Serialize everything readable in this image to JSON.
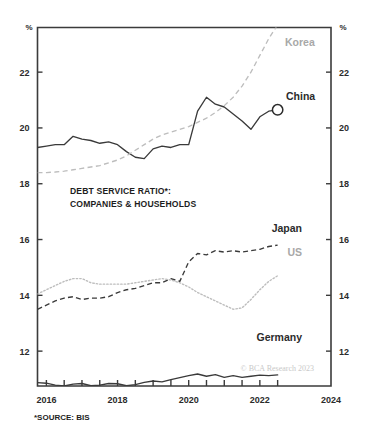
{
  "chart_data": {
    "type": "line",
    "title": "DEBT SERVICE RATIO*: COMPANIES & HOUSEHOLDS",
    "title_line1": "DEBT SERVICE RATIO*:",
    "title_line2": "COMPANIES & HOUSEHOLDS",
    "xlabel": "",
    "ylabel": "%",
    "ylabel_right": "%",
    "xlim": [
      2015.75,
      2024.0
    ],
    "ylim": [
      10.75,
      23.6
    ],
    "grid": false,
    "legend_position": "inline-right",
    "x_tick_labels": [
      "2016",
      "2018",
      "2020",
      "2022",
      "2024"
    ],
    "x_tick_values": [
      2016,
      2018,
      2020,
      2022,
      2024
    ],
    "x_minor_tick_values": [
      2016,
      2016.5,
      2017,
      2017.5,
      2018,
      2018.5,
      2019,
      2019.5,
      2020,
      2020.5,
      2021,
      2021.5,
      2022,
      2022.5
    ],
    "y_tick_labels": [
      "12",
      "14",
      "16",
      "18",
      "20",
      "22"
    ],
    "y_tick_values": [
      12,
      14,
      16,
      18,
      20,
      22
    ],
    "footnote": "*SOURCE: BIS",
    "watermark": "© BCA Research 2023",
    "series": [
      {
        "name": "China",
        "label": "China",
        "style": "solid",
        "color": "#3a3a3a",
        "label_color": "#2b2b2b",
        "end_marker": "circle",
        "x": [
          2015.75,
          2016.0,
          2016.25,
          2016.5,
          2016.75,
          2017.0,
          2017.25,
          2017.5,
          2017.75,
          2018.0,
          2018.25,
          2018.5,
          2018.75,
          2019.0,
          2019.25,
          2019.5,
          2019.75,
          2020.0,
          2020.25,
          2020.5,
          2020.75,
          2021.0,
          2021.25,
          2021.5,
          2021.75,
          2022.0,
          2022.25,
          2022.5
        ],
        "values": [
          19.3,
          19.35,
          19.4,
          19.4,
          19.7,
          19.6,
          19.55,
          19.45,
          19.5,
          19.4,
          19.15,
          18.95,
          18.9,
          19.25,
          19.35,
          19.3,
          19.4,
          19.4,
          20.6,
          21.1,
          20.85,
          20.75,
          20.5,
          20.25,
          19.95,
          20.4,
          20.6,
          20.65
        ]
      },
      {
        "name": "Korea",
        "label": "Korea",
        "style": "dashed",
        "color": "#bdbdbd",
        "label_color": "#a8a8a8",
        "end_marker": "none",
        "x": [
          2015.75,
          2016.0,
          2016.25,
          2016.5,
          2016.75,
          2017.0,
          2017.25,
          2017.5,
          2017.75,
          2018.0,
          2018.25,
          2018.5,
          2018.75,
          2019.0,
          2019.25,
          2019.5,
          2019.75,
          2020.0,
          2020.25,
          2020.5,
          2020.75,
          2021.0,
          2021.25,
          2021.5,
          2021.75,
          2022.0,
          2022.25,
          2022.5
        ],
        "values": [
          18.4,
          18.4,
          18.42,
          18.45,
          18.5,
          18.55,
          18.6,
          18.65,
          18.75,
          18.85,
          19.0,
          19.2,
          19.4,
          19.6,
          19.75,
          19.85,
          19.95,
          20.05,
          20.2,
          20.35,
          20.55,
          20.8,
          21.1,
          21.5,
          22.0,
          22.6,
          23.2,
          23.7
        ]
      },
      {
        "name": "Japan",
        "label": "Japan",
        "style": "dashed",
        "color": "#3a3a3a",
        "label_color": "#2b2b2b",
        "end_marker": "none",
        "x": [
          2015.75,
          2016.0,
          2016.25,
          2016.5,
          2016.75,
          2017.0,
          2017.25,
          2017.5,
          2017.75,
          2018.0,
          2018.25,
          2018.5,
          2018.75,
          2019.0,
          2019.25,
          2019.5,
          2019.75,
          2020.0,
          2020.25,
          2020.5,
          2020.75,
          2021.0,
          2021.25,
          2021.5,
          2021.75,
          2022.0,
          2022.25,
          2022.5
        ],
        "values": [
          13.5,
          13.65,
          13.8,
          13.9,
          13.95,
          13.85,
          13.9,
          13.9,
          13.95,
          14.1,
          14.2,
          14.25,
          14.35,
          14.45,
          14.45,
          14.6,
          14.5,
          15.2,
          15.5,
          15.45,
          15.6,
          15.55,
          15.6,
          15.55,
          15.6,
          15.65,
          15.75,
          15.8
        ]
      },
      {
        "name": "US",
        "label": "US",
        "style": "dotted",
        "color": "#bdbdbd",
        "label_color": "#a8a8a8",
        "end_marker": "none",
        "x": [
          2015.75,
          2016.0,
          2016.25,
          2016.5,
          2016.75,
          2017.0,
          2017.25,
          2017.5,
          2017.75,
          2018.0,
          2018.25,
          2018.5,
          2018.75,
          2019.0,
          2019.25,
          2019.5,
          2019.75,
          2020.0,
          2020.25,
          2020.5,
          2020.75,
          2021.0,
          2021.25,
          2021.5,
          2021.75,
          2022.0,
          2022.25,
          2022.5
        ],
        "values": [
          14.05,
          14.2,
          14.35,
          14.5,
          14.6,
          14.6,
          14.45,
          14.4,
          14.4,
          14.4,
          14.4,
          14.45,
          14.5,
          14.55,
          14.6,
          14.55,
          14.45,
          14.3,
          14.1,
          13.95,
          13.8,
          13.65,
          13.5,
          13.55,
          13.85,
          14.2,
          14.5,
          14.7
        ]
      },
      {
        "name": "Germany",
        "label": "Germany",
        "style": "solid",
        "color": "#3a3a3a",
        "label_color": "#2b2b2b",
        "end_marker": "none",
        "x": [
          2015.75,
          2016.0,
          2016.25,
          2016.5,
          2016.75,
          2017.0,
          2017.25,
          2017.5,
          2017.75,
          2018.0,
          2018.25,
          2018.5,
          2018.75,
          2019.0,
          2019.25,
          2019.5,
          2019.75,
          2020.0,
          2020.25,
          2020.5,
          2020.75,
          2021.0,
          2021.25,
          2021.5,
          2021.75,
          2022.0,
          2022.25,
          2022.5
        ],
        "values": [
          10.87,
          10.85,
          10.78,
          10.75,
          10.82,
          10.84,
          10.76,
          10.78,
          10.84,
          10.83,
          10.76,
          10.8,
          10.88,
          10.93,
          10.9,
          10.98,
          11.05,
          11.12,
          11.18,
          11.1,
          11.16,
          11.06,
          11.12,
          11.06,
          11.1,
          11.14,
          11.12,
          11.15
        ]
      }
    ]
  }
}
